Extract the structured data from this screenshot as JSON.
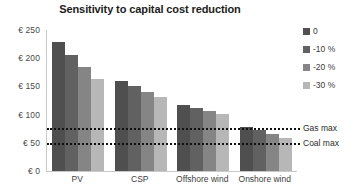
{
  "chart_data": {
    "type": "bar",
    "title": "Sensitivity to capital cost reduction",
    "xlabel": "",
    "ylabel": "",
    "ylim": [
      0,
      250
    ],
    "grid": false,
    "legend_position": "right",
    "categories": [
      "PV",
      "CSP",
      "Offshore wind",
      "Onshore wind"
    ],
    "y_ticks": [
      {
        "value": 250,
        "label": "€ 250"
      },
      {
        "value": 200,
        "label": "€ 200"
      },
      {
        "value": 150,
        "label": "€ 150"
      },
      {
        "value": 100,
        "label": "€ 100"
      },
      {
        "value": 50,
        "label": "€ 50"
      },
      {
        "value": 0,
        "label": "€ 0"
      }
    ],
    "series": [
      {
        "name": "0",
        "color": "#4f4f4f",
        "values": [
          229,
          160,
          117,
          78
        ]
      },
      {
        "name": "-10 %",
        "color": "#616161",
        "values": [
          206,
          151,
          112,
          73
        ]
      },
      {
        "name": "-20 %",
        "color": "#858585",
        "values": [
          184,
          140,
          106,
          66
        ]
      },
      {
        "name": "-30 %",
        "color": "#b7b7b7",
        "values": [
          163,
          131,
          101,
          59
        ]
      }
    ],
    "reference_lines": [
      {
        "label": "Gas max",
        "value": 76,
        "color": "#111111",
        "style": "dotted"
      },
      {
        "label": "Coal max",
        "value": 50,
        "color": "#111111",
        "style": "dotted"
      }
    ]
  }
}
